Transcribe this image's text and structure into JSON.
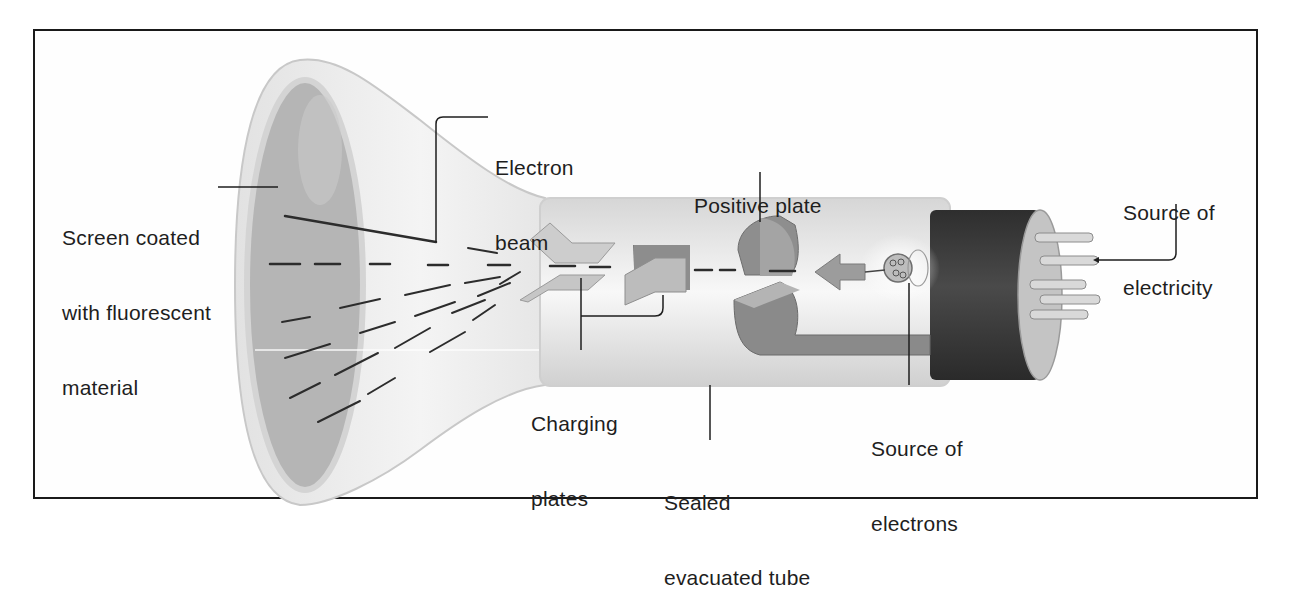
{
  "diagram": {
    "labels": {
      "screen": {
        "line1": "Screen coated",
        "line2": "with fluorescent",
        "line3": "material"
      },
      "electron_beam": {
        "line1": "Electron",
        "line2": "beam"
      },
      "positive_plate": {
        "line1": "Positive plate"
      },
      "source_electricity": {
        "line1": "Source of",
        "line2": "electricity"
      },
      "charging_plates": {
        "line1": "Charging",
        "line2": "plates"
      },
      "sealed_tube": {
        "line1": "Sealed",
        "line2": "evacuated tube"
      },
      "source_electrons": {
        "line1": "Source of",
        "line2": "electrons"
      }
    },
    "colors": {
      "border": "#1a1a1a",
      "screen": "#b5b5b5",
      "glass": "#e8e8e8",
      "plates": "#bdbdbd",
      "dark_plates": "#8a8a8a",
      "base_cap": "#3a3a3a",
      "text": "#1e1e1e"
    }
  }
}
